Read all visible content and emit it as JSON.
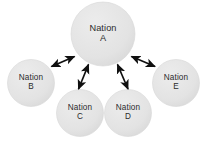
{
  "diagram": {
    "type": "hub-and-spoke",
    "background_color": "#ffffff",
    "node_fill": "#e3e3e3",
    "node_edge": "#d2d2d2",
    "text_color": "#2b2b2b",
    "arrow_color": "#101010",
    "nodes": [
      {
        "id": "A",
        "name": "nation-a",
        "line1": "Nation",
        "line2": "A",
        "role": "hub",
        "cx": 103,
        "cy": 34,
        "r": 32
      },
      {
        "id": "B",
        "name": "nation-b",
        "line1": "Nation",
        "line2": "B",
        "role": "satellite",
        "cx": 31,
        "cy": 83,
        "r": 23.5
      },
      {
        "id": "C",
        "name": "nation-c",
        "line1": "Nation",
        "line2": "C",
        "role": "satellite",
        "cx": 80,
        "cy": 113,
        "r": 23.5
      },
      {
        "id": "D",
        "name": "nation-d",
        "line1": "Nation",
        "line2": "D",
        "role": "satellite",
        "cx": 128,
        "cy": 113,
        "r": 23.5
      },
      {
        "id": "E",
        "name": "nation-e",
        "line1": "Nation",
        "line2": "E",
        "role": "satellite",
        "cx": 176,
        "cy": 83,
        "r": 23.5
      }
    ],
    "edges": [
      {
        "name": "connector-a-b",
        "from": "A",
        "to": "B",
        "arrowheads": "both",
        "x1": 74.5,
        "y1": 56.5,
        "x2": 51.5,
        "y2": 66.5
      },
      {
        "name": "connector-a-c",
        "from": "A",
        "to": "C",
        "arrowheads": "both",
        "x1": 88.5,
        "y1": 64.5,
        "x2": 78.5,
        "y2": 89.0
      },
      {
        "name": "connector-a-d",
        "from": "A",
        "to": "D",
        "arrowheads": "both",
        "x1": 117.5,
        "y1": 64.5,
        "x2": 128.0,
        "y2": 89.0
      },
      {
        "name": "connector-a-e",
        "from": "A",
        "to": "E",
        "arrowheads": "both",
        "x1": 131.5,
        "y1": 56.5,
        "x2": 155.0,
        "y2": 66.5
      }
    ]
  }
}
